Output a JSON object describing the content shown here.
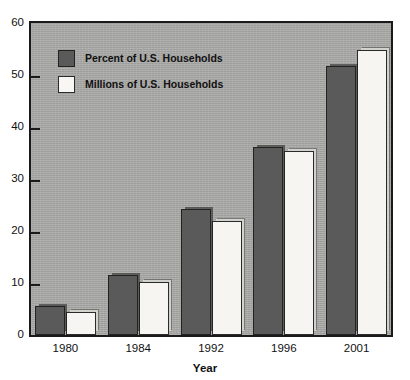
{
  "chart_data": {
    "type": "bar",
    "title": "",
    "subtitle": "",
    "xlabel": "Year",
    "ylabel": "",
    "categories": [
      "1980",
      "1984",
      "1992",
      "1996",
      "2001"
    ],
    "series": [
      {
        "name": "Percent of U.S. Households",
        "color": "#5a5a5a",
        "values": [
          5.6,
          11.6,
          24.3,
          36.2,
          51.7
        ]
      },
      {
        "name": "Millions of U.S. Households",
        "color": "#f6f5f1",
        "values": [
          4.4,
          10.1,
          22.0,
          35.3,
          54.9
        ]
      }
    ],
    "ylim": [
      0,
      60
    ],
    "yticks": [
      0,
      10,
      20,
      30,
      40,
      50,
      60
    ],
    "ytick_labels": [
      "0",
      "10",
      "20",
      "30",
      "40",
      "50",
      "60"
    ],
    "grid": false,
    "legend_position": "top-left",
    "plot_background": "#a9a9a7",
    "axis_color": "#1a1a1a"
  },
  "legend": {
    "items": [
      {
        "label": "Percent of U.S. Households",
        "swatch": "dark"
      },
      {
        "label": "Millions of U.S. Households",
        "swatch": "light"
      }
    ]
  },
  "axis": {
    "x_title": "Year"
  }
}
